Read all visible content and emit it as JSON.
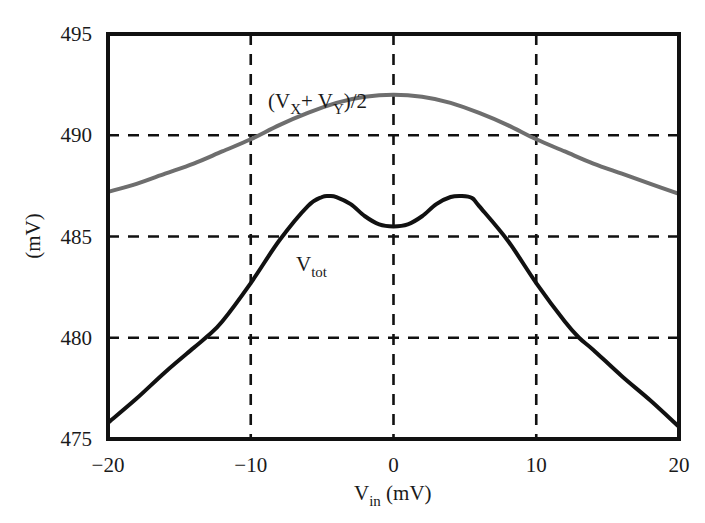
{
  "chart_data": {
    "type": "line",
    "title": "",
    "xlabel": "V_in (mV)",
    "ylabel": "(mV)",
    "xlim": [
      -20,
      20
    ],
    "ylim": [
      475,
      495
    ],
    "xticks": [
      -20,
      -10,
      0,
      10,
      20
    ],
    "yticks": [
      475,
      480,
      485,
      490,
      495
    ],
    "xtick_labels": [
      "−20",
      "−10",
      "0",
      "10",
      "20"
    ],
    "ytick_labels": [
      "475",
      "480",
      "485",
      "490",
      "495"
    ],
    "grid": true,
    "grid_style": "dashed",
    "legend": "none (inline annotations)",
    "series": [
      {
        "name": "(V_X+ V_Y)/2",
        "color": "#6e6e6e",
        "x": [
          -20,
          -18,
          -16,
          -14,
          -12,
          -10,
          -8,
          -6,
          -4,
          -2,
          0,
          2,
          4,
          6,
          8,
          10,
          12,
          14,
          16,
          18,
          20
        ],
        "values": [
          487.2,
          487.6,
          488.1,
          488.6,
          489.2,
          489.8,
          490.5,
          491.1,
          491.6,
          491.9,
          492.0,
          491.9,
          491.6,
          491.1,
          490.5,
          489.8,
          489.2,
          488.6,
          488.1,
          487.6,
          487.1
        ]
      },
      {
        "name": "V_tot",
        "color": "#111111",
        "x": [
          -20,
          -18,
          -16,
          -14,
          -13,
          -12,
          -10,
          -8,
          -6,
          -5,
          -4.5,
          -4,
          -3,
          -2,
          -1,
          0,
          1,
          2,
          3,
          4,
          4.8,
          5.5,
          6,
          8,
          10,
          12,
          13,
          14,
          16,
          18,
          20
        ],
        "values": [
          475.8,
          477.0,
          478.3,
          479.5,
          480.1,
          480.8,
          482.7,
          484.8,
          486.5,
          486.95,
          487.0,
          486.95,
          486.6,
          486.0,
          485.6,
          485.5,
          485.6,
          486.0,
          486.6,
          486.95,
          487.0,
          486.9,
          486.5,
          484.8,
          482.7,
          480.8,
          480.0,
          479.4,
          478.1,
          476.9,
          475.6
        ]
      }
    ],
    "annotations": [
      {
        "text_main": "(V",
        "sub1": "X",
        "mid": "+ V",
        "sub2": "Y",
        "tail": ")/2",
        "x": -8.2,
        "y": 492.7
      },
      {
        "text_main": "V",
        "sub": "tot",
        "x": -7.8,
        "y": 484.1
      }
    ]
  },
  "labels": {
    "xlabel_main": "V",
    "xlabel_sub": "in",
    "xlabel_tail": " (mV)",
    "ylabel": "(mV)",
    "gray_main": "(V",
    "gray_sub1": "X",
    "gray_mid": "+ V",
    "gray_sub2": "Y",
    "gray_tail": ")/2",
    "tot_main": "V",
    "tot_sub": "tot"
  }
}
